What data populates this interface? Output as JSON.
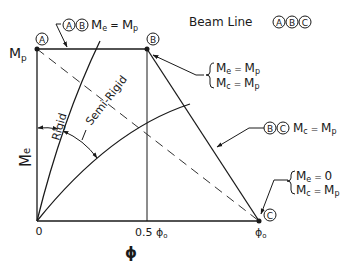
{
  "legend_title": {
    "text": "Beam Line",
    "points": [
      "A",
      "B",
      "C"
    ]
  },
  "axes": {
    "y_label": "M",
    "y_label_sub": "e",
    "y_tick": "M",
    "y_tick_sub": "p",
    "x_label": "ϕ",
    "x_ticks": [
      {
        "main": "0",
        "sub": ""
      },
      {
        "main": "0.5 ϕ",
        "sub": "o"
      },
      {
        "main": "ϕ",
        "sub": "o"
      }
    ]
  },
  "points": {
    "A": "A",
    "B": "B",
    "C": "C"
  },
  "curves": {
    "rigid": "Rigid",
    "semi_rigid": "Semi-Rigid"
  },
  "annotations": {
    "ab": {
      "circles": [
        "A",
        "B"
      ],
      "lhs": "M",
      "lhs_sub": "e",
      "eq": " = ",
      "rhs": "M",
      "rhs_sub": "p"
    },
    "b_conditions": [
      {
        "lhs": "M",
        "lhs_sub": "e",
        "eq": " = ",
        "rhs": "M",
        "rhs_sub": "p"
      },
      {
        "lhs": "M",
        "lhs_sub": "c",
        "eq": " = ",
        "rhs": "M",
        "rhs_sub": "p"
      }
    ],
    "bc": {
      "circles": [
        "B",
        "C"
      ],
      "lhs": "M",
      "lhs_sub": "c",
      "eq": " = ",
      "rhs": "M",
      "rhs_sub": "p"
    },
    "c_conditions": [
      {
        "lhs": "M",
        "lhs_sub": "e",
        "eq": " = ",
        "rhs": "0",
        "rhs_sub": ""
      },
      {
        "lhs": "M",
        "lhs_sub": "c",
        "eq": " = ",
        "rhs": "M",
        "rhs_sub": "p"
      }
    ]
  }
}
